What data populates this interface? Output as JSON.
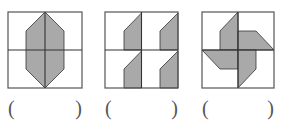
{
  "figures": [
    {
      "id": "figure-1",
      "description": "vertical hexagon symmetric about both axes",
      "box": {
        "x": 8,
        "y": 12,
        "w": 74,
        "h": 76
      },
      "shapes": [
        {
          "points": "45,12 64,31 64,69 45,88 26,69 26,31"
        }
      ],
      "answer_blank": {
        "open": "(",
        "close": ")",
        "value": ""
      }
    },
    {
      "id": "figure-2",
      "description": "same pentagon repeated in each quadrant (translation)",
      "box": {
        "x": 105,
        "y": 12,
        "w": 73,
        "h": 76
      },
      "shapes": [
        {
          "points": "124,50 124,31 141.5,13 141.5,50"
        },
        {
          "points": "160,50 160,31 178,13 178,50"
        },
        {
          "points": "124,88 124,69 141.5,51 141.5,88"
        },
        {
          "points": "160,88 160,69 178,51 178,88"
        }
      ],
      "answer_blank": {
        "open": "(",
        "close": ")",
        "value": ""
      }
    },
    {
      "id": "figure-3",
      "description": "pinwheel of four blades (rotation)",
      "box": {
        "x": 202,
        "y": 12,
        "w": 72,
        "h": 76
      },
      "shapes": [
        {
          "points": "238,12 220,31 220,50 238,50"
        },
        {
          "points": "238,31 256,31 274,50 238,50"
        },
        {
          "points": "202,50 238,50 238,69 220,69"
        },
        {
          "points": "238,50 256,50 256,69 238,88"
        }
      ],
      "answer_blank": {
        "open": "(",
        "close": ")",
        "value": ""
      }
    }
  ],
  "colors": {
    "fill": "#a9a9a9",
    "stroke": "#333333",
    "box_stroke": "#555555"
  }
}
